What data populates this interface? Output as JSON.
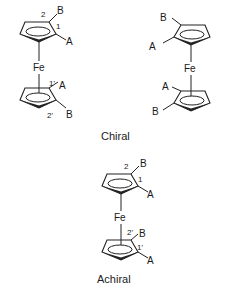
{
  "diagram": {
    "molecules": [
      {
        "id": "chiral-left",
        "metal": "Fe",
        "top_ring": {
          "substituents": [
            {
              "pos": "1",
              "group": "A"
            },
            {
              "pos": "2",
              "group": "B"
            }
          ]
        },
        "bottom_ring": {
          "substituents": [
            {
              "pos": "1'",
              "group": "A"
            },
            {
              "pos": "2'",
              "group": "B"
            }
          ]
        }
      },
      {
        "id": "chiral-right",
        "metal": "Fe",
        "top_ring": {
          "substituents": [
            {
              "group": "B"
            },
            {
              "group": "A"
            }
          ]
        },
        "bottom_ring": {
          "substituents": [
            {
              "group": "A"
            },
            {
              "group": "B"
            }
          ]
        }
      },
      {
        "id": "achiral-bottom",
        "metal": "Fe",
        "top_ring": {
          "substituents": [
            {
              "pos": "1",
              "group": "A"
            },
            {
              "pos": "2",
              "group": "B"
            }
          ]
        },
        "bottom_ring": {
          "substituents": [
            {
              "pos": "1'",
              "group": "A"
            },
            {
              "pos": "2'",
              "group": "B"
            }
          ]
        }
      }
    ],
    "captions": {
      "chiral": "Chiral",
      "achiral": "Achiral"
    },
    "labels": {
      "fe": "Fe",
      "a": "A",
      "b": "B",
      "p1": "1",
      "p2": "2",
      "p1p": "1'",
      "p2p": "2'"
    }
  }
}
